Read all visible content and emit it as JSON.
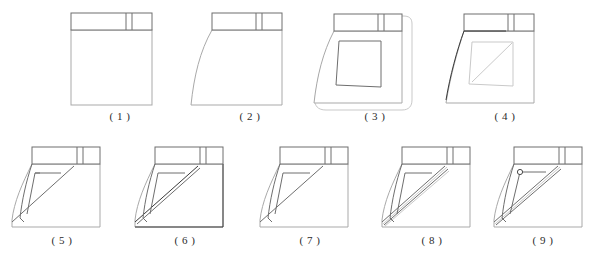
{
  "document": {
    "title": "Jeans front pocket construction steps",
    "background_color": "#ffffff",
    "line_color_dark": "#3a3a3a",
    "line_color_mid": "#6e6e6e",
    "line_color_light": "#a9a9a9",
    "line_color_faint": "#c9c9c9"
  },
  "figures": [
    {
      "id": "step-1",
      "caption": "( 1 )",
      "row": "top",
      "description": "Plain rectangular panel with horizontal waistband band and belt-loop marks at upper right"
    },
    {
      "id": "step-2",
      "caption": "( 2 )",
      "row": "top",
      "description": "Panel with curved left side edge added below waistband"
    },
    {
      "id": "step-3",
      "caption": "( 3 )",
      "row": "top",
      "description": "Panel with inner quadrilateral pocket bag outline and soft rounded outer guide outline"
    },
    {
      "id": "step-4",
      "caption": "( 4 )",
      "row": "top",
      "description": "Panel with faint pocket bag and darker curved side seam emphasised"
    },
    {
      "id": "step-5",
      "caption": "( 5 )",
      "row": "bottom",
      "description": "Pocket opening drawn as diagonal line from waistband to lower left corner"
    },
    {
      "id": "step-6",
      "caption": "( 6 )",
      "row": "bottom",
      "description": "Double diagonal stitch line along the pocket opening"
    },
    {
      "id": "step-7",
      "caption": "( 7 )",
      "row": "bottom",
      "description": "Pocket opening refined with single clean diagonal and inner facing shape"
    },
    {
      "id": "step-8",
      "caption": "( 8 )",
      "row": "bottom",
      "description": "Multiple parallel topstitch lines along the diagonal pocket opening"
    },
    {
      "id": "step-9",
      "caption": "( 9 )",
      "row": "bottom",
      "description": "Finished pocket with topstitching and a rivet at the pocket corner"
    }
  ]
}
